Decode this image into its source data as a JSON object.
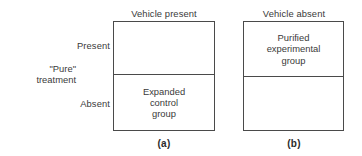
{
  "figure": {
    "row_axis": {
      "title_line1": "\"Pure\"",
      "title_line2": "treatment",
      "levels": [
        {
          "label": "Present"
        },
        {
          "label": "Absent"
        }
      ]
    },
    "panels": [
      {
        "id": "a",
        "caption": "(a)",
        "column_header": "Vehicle present",
        "cells": [
          {
            "row": "Present",
            "label_lines": []
          },
          {
            "row": "Absent",
            "label_lines": [
              "Expanded",
              "control",
              "group"
            ]
          }
        ]
      },
      {
        "id": "b",
        "caption": "(b)",
        "column_header": "Vehicle absent",
        "cells": [
          {
            "row": "Present",
            "label_lines": [
              "Purified",
              "experimental",
              "group"
            ]
          },
          {
            "row": "Absent",
            "label_lines": []
          }
        ]
      }
    ],
    "colors": {
      "line": "#4a4a4a",
      "text": "#3a3a3a",
      "background": "#ffffff"
    }
  }
}
